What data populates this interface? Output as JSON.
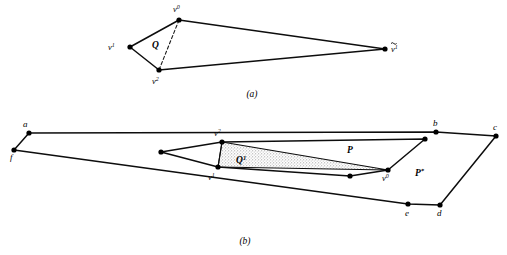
{
  "figure": {
    "background_color": "#ffffff",
    "ink_color": "#0d0d0d",
    "shade_color": "#b9b9b9",
    "panels": [
      {
        "id": "a",
        "caption": "(a)",
        "caption_pos": [
          252,
          95
        ],
        "labels": [
          {
            "name": "label-v0",
            "base": "v",
            "sup": "0",
            "tilde": false,
            "x": 173,
            "y": 12
          },
          {
            "name": "label-v1",
            "base": "v",
            "sup": "1",
            "tilde": false,
            "x": 112,
            "y": 50
          },
          {
            "name": "label-v2",
            "base": "v",
            "sup": "2",
            "tilde": false,
            "x": 152,
            "y": 83
          },
          {
            "name": "label-v1-tilde",
            "base": "v",
            "sup": "1",
            "tilde": true,
            "x": 390,
            "y": 52
          }
        ],
        "region_labels": [
          {
            "name": "region-label-Q",
            "base": "Q",
            "sup": "",
            "x": 156,
            "y": 47
          }
        ],
        "vertices": [
          {
            "name": "vertex-v0",
            "x": 179,
            "y": 20
          },
          {
            "name": "vertex-v1",
            "x": 130,
            "y": 47
          },
          {
            "name": "vertex-v2",
            "x": 159,
            "y": 70
          },
          {
            "name": "vertex-v1-tilde",
            "x": 385,
            "y": 49
          }
        ],
        "solid_path": "M 179 20 L 130 47 L 159 70 L 385 49 L 179 20 Z",
        "dashed_path": "M 179 20 L 159 70"
      },
      {
        "id": "b",
        "caption": "(b)",
        "caption_pos": [
          245,
          242
        ],
        "labels": [
          {
            "name": "label-a",
            "base": "a",
            "sup": "",
            "tilde": false,
            "x": 23,
            "y": 126
          },
          {
            "name": "label-b",
            "base": "b",
            "sup": "",
            "tilde": false,
            "x": 434,
            "y": 126
          },
          {
            "name": "label-c",
            "base": "c",
            "sup": "",
            "tilde": false,
            "x": 494,
            "y": 128
          },
          {
            "name": "label-d",
            "base": "d",
            "sup": "",
            "tilde": false,
            "x": 438,
            "y": 214
          },
          {
            "name": "label-e",
            "base": "e",
            "sup": "",
            "tilde": false,
            "x": 406,
            "y": 214
          },
          {
            "name": "label-f",
            "base": "f",
            "sup": "",
            "tilde": false,
            "x": 11,
            "y": 157
          },
          {
            "name": "label-v2-b",
            "base": "v",
            "sup": "2",
            "tilde": false,
            "x": 214,
            "y": 137
          },
          {
            "name": "label-v1-b",
            "base": "v",
            "sup": "1",
            "tilde": false,
            "x": 210,
            "y": 178
          },
          {
            "name": "label-v0-b",
            "base": "v",
            "sup": "0",
            "tilde": false,
            "x": 384,
            "y": 179
          }
        ],
        "region_labels": [
          {
            "name": "region-label-Q1",
            "base": "Q",
            "sup": "1",
            "x": 241,
            "y": 161
          },
          {
            "name": "region-label-P",
            "base": "P",
            "sup": "",
            "x": 351,
            "y": 152
          },
          {
            "name": "region-label-Pstar",
            "base": "P",
            "sup": "*",
            "x": 419,
            "y": 174
          }
        ],
        "vertices": [
          {
            "name": "vertex-a",
            "x": 29,
            "y": 133
          },
          {
            "name": "vertex-b",
            "x": 436,
            "y": 132
          },
          {
            "name": "vertex-c",
            "x": 496,
            "y": 136
          },
          {
            "name": "vertex-d",
            "x": 440,
            "y": 205
          },
          {
            "name": "vertex-e",
            "x": 408,
            "y": 204
          },
          {
            "name": "vertex-f",
            "x": 14,
            "y": 150
          },
          {
            "name": "vertex-inner-left",
            "x": 161,
            "y": 152
          },
          {
            "name": "vertex-v2-b",
            "x": 222,
            "y": 142
          },
          {
            "name": "vertex-v1-b",
            "x": 218,
            "y": 167
          },
          {
            "name": "vertex-inner-bottom",
            "x": 350,
            "y": 176
          },
          {
            "name": "vertex-v0-b",
            "x": 388,
            "y": 170
          },
          {
            "name": "vertex-inner-topright",
            "x": 425,
            "y": 139
          }
        ],
        "outer_path": "M 29 133 L 436 132 L 496 136 L 440 205 L 408 204 L 14 150 L 29 133 Z",
        "inner_path": "M 161 152 L 222 142 L 425 139 L 388 170 L 350 176 L 218 167 L 161 152 Z",
        "shaded_path": "M 222 142 L 388 170 L 218 167 Z",
        "chord_path": "M 222 142 L 218 167"
      }
    ]
  }
}
